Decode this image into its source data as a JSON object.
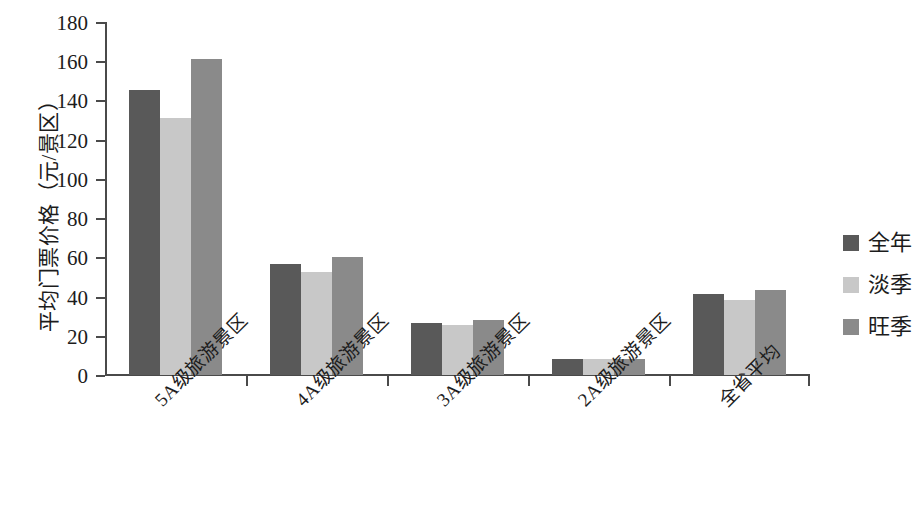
{
  "chart_data": {
    "type": "bar",
    "title": "",
    "xlabel": "",
    "ylabel": "平均门票价格（元/景区）",
    "ylim": [
      0,
      180
    ],
    "ytick_step": 20,
    "yticks": [
      0,
      20,
      40,
      60,
      80,
      100,
      120,
      140,
      160,
      180
    ],
    "grid": false,
    "legend_position": "right",
    "categories": [
      "5A级旅游景区",
      "4A级旅游景区",
      "3A级旅游景区",
      "2A级旅游景区",
      "全省平均"
    ],
    "series": [
      {
        "name": "全年",
        "color": "#595959",
        "values": [
          145.5,
          56.5,
          26.5,
          8,
          41.5
        ]
      },
      {
        "name": "淡季",
        "color": "#c8c8c8",
        "values": [
          131,
          52.5,
          25.5,
          8,
          38.5
        ]
      },
      {
        "name": "旺季",
        "color": "#8a8a8a",
        "values": [
          161,
          60,
          28,
          8,
          43.5
        ]
      }
    ]
  },
  "axis": {
    "y_title": "平均门票价格（元/景区）",
    "tick_labels": [
      "180",
      "160",
      "140",
      "120",
      "100",
      "80",
      "60",
      "40",
      "20",
      "0"
    ]
  },
  "legend": {
    "items": [
      {
        "label": "全年",
        "color": "#595959"
      },
      {
        "label": "淡季",
        "color": "#c8c8c8"
      },
      {
        "label": "旺季",
        "color": "#8a8a8a"
      }
    ]
  }
}
